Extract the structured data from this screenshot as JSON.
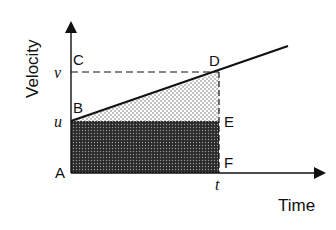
{
  "diagram": {
    "type": "velocity-time graph",
    "axes": {
      "y_label": "Velocity",
      "x_label": "Time"
    },
    "value_labels": {
      "v": "v",
      "u": "u",
      "t": "t"
    },
    "points": {
      "A": "A",
      "B": "B",
      "C": "C",
      "D": "D",
      "E": "E",
      "F": "F"
    },
    "regions": [
      {
        "name": "triangle-BDE",
        "fill": "light stipple"
      },
      {
        "name": "rectangle-ABEF",
        "fill": "dark crosshatch"
      }
    ],
    "colors": {
      "ink": "#111111",
      "light_fill": "#e6e6e6",
      "dark_fill": "#3a3a3a"
    }
  }
}
